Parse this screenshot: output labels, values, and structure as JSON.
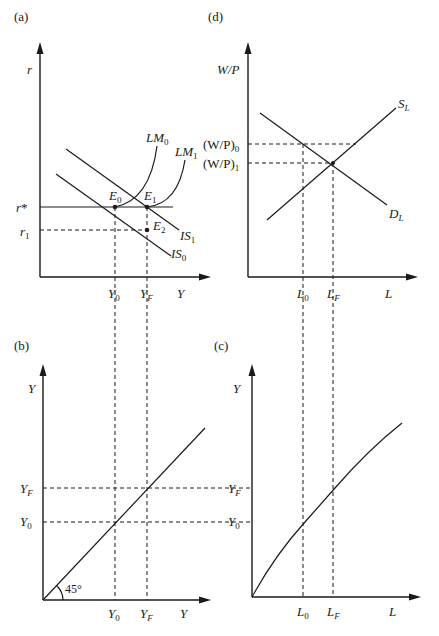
{
  "figure": {
    "width": 439,
    "height": 636,
    "line_color": "#1a1a1a",
    "background": "#ffffff"
  },
  "panels": {
    "a": {
      "label": "(a)",
      "title_desc": "IS-LM diagram",
      "y_axis_label": "r",
      "x_axis_label": "Y",
      "y_ticks": [
        {
          "main": "r",
          "sub": "",
          "sup": "*",
          "y": 207
        },
        {
          "main": "r",
          "sub": "1",
          "sup": "",
          "y": 231
        }
      ],
      "x_ticks": [
        {
          "main": "Y",
          "sub": "0",
          "x": 115
        },
        {
          "main": "Y",
          "sub": "F",
          "x": 147
        }
      ],
      "curves": [
        {
          "name": "LM",
          "sub": "0"
        },
        {
          "name": "LM",
          "sub": "1"
        },
        {
          "name": "IS",
          "sub": "0"
        },
        {
          "name": "IS",
          "sub": "1"
        }
      ],
      "points": [
        {
          "name": "E",
          "sub": "0"
        },
        {
          "name": "E",
          "sub": "1"
        },
        {
          "name": "E",
          "sub": "2"
        }
      ]
    },
    "b": {
      "label": "(b)",
      "title_desc": "45-degree line",
      "y_axis_label": "Y",
      "x_axis_label": "Y",
      "angle_label": "45°",
      "y_ticks": [
        {
          "main": "Y",
          "sub": "F"
        },
        {
          "main": "Y",
          "sub": "0"
        }
      ],
      "x_ticks": [
        {
          "main": "Y",
          "sub": "0"
        },
        {
          "main": "Y",
          "sub": "F"
        }
      ]
    },
    "c": {
      "label": "(c)",
      "title_desc": "Production function",
      "y_axis_label": "Y",
      "x_axis_label": "L",
      "y_ticks": [
        {
          "main": "Y",
          "sub": "F"
        },
        {
          "main": "Y",
          "sub": "0"
        }
      ],
      "x_ticks": [
        {
          "main": "L",
          "sub": "0"
        },
        {
          "main": "L",
          "sub": "F"
        }
      ]
    },
    "d": {
      "label": "(d)",
      "title_desc": "Labor market",
      "y_axis_label": "W/P",
      "x_axis_label": "L",
      "y_ticks": [
        {
          "main": "(W/P)",
          "sub": "0"
        },
        {
          "main": "(W/P)",
          "sub": "1"
        }
      ],
      "x_ticks": [
        {
          "main": "L",
          "sub": "0"
        },
        {
          "main": "L",
          "sub": "F"
        }
      ],
      "curves": [
        {
          "name": "S",
          "sub": "L"
        },
        {
          "name": "D",
          "sub": "L"
        }
      ]
    }
  }
}
